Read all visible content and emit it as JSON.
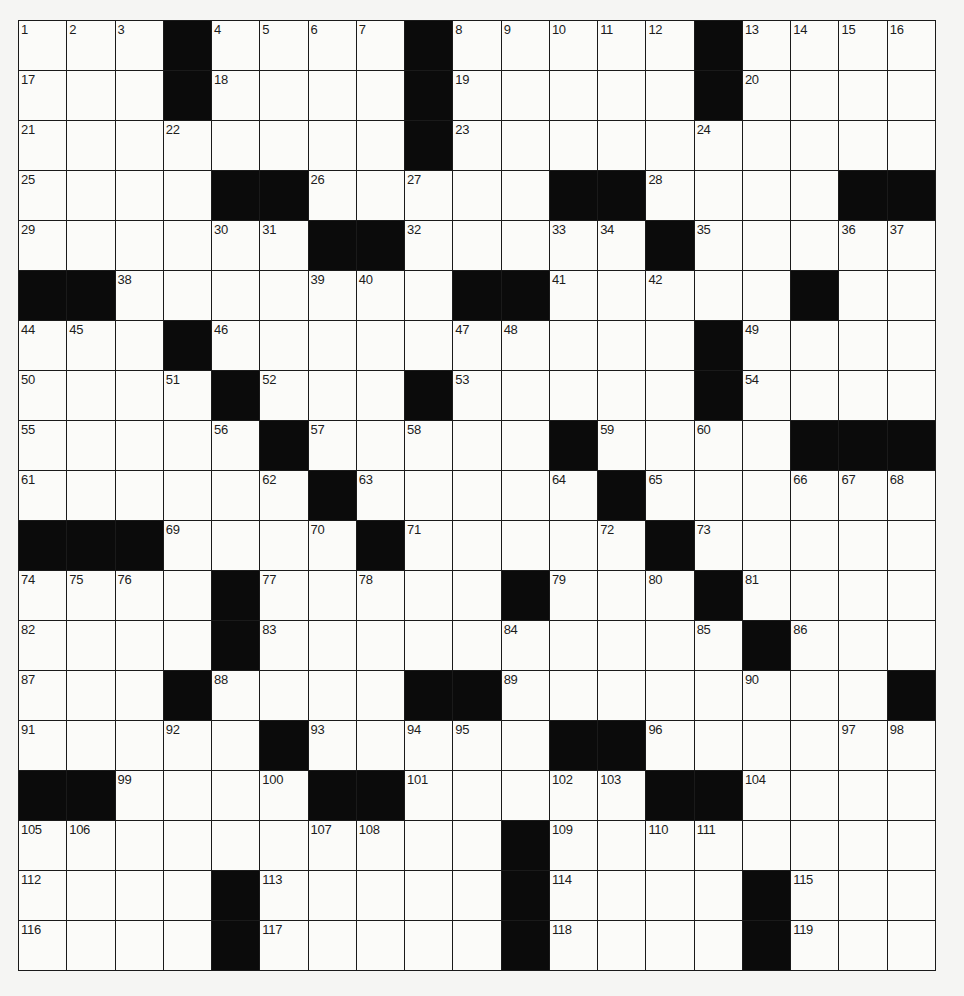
{
  "puzzle": {
    "rows": 19,
    "cols": 19,
    "colors": {
      "background": "#f5f5f3",
      "cell_white": "#fbfbf9",
      "cell_black": "#0b0b0b",
      "grid_line": "#1a1a1a",
      "number_text": "#1c1c1c"
    },
    "layout": [
      "...#....#.....#....",
      "...#....#.....#....",
      "........#..........",
      "....##.....##....##",
      "......##.....#.....",
      "##.......##.....#..",
      "...#..........#....",
      "....#...#.....#....",
      ".....#.....#....###",
      "......#.....#......",
      "###....#.....#.....",
      "....#.....#...#....",
      "....#..........#...",
      "...#....##........##",
      ".....#.....##......",
      "##....##.....##....",
      "..........#........",
      "....#.....#....#...",
      "....#.....#....#..."
    ],
    "numbers": [
      [
        1,
        2,
        3,
        0,
        4,
        5,
        6,
        7,
        0,
        8,
        9,
        10,
        11,
        12,
        0,
        13,
        14,
        15,
        16
      ],
      [
        17,
        0,
        0,
        0,
        18,
        0,
        0,
        0,
        0,
        19,
        0,
        0,
        0,
        0,
        0,
        20,
        0,
        0,
        0
      ],
      [
        21,
        0,
        0,
        22,
        0,
        0,
        0,
        0,
        0,
        23,
        0,
        0,
        0,
        0,
        24,
        0,
        0,
        0,
        0
      ],
      [
        25,
        0,
        0,
        0,
        0,
        0,
        26,
        0,
        27,
        0,
        0,
        0,
        0,
        28,
        0,
        0,
        0,
        0,
        0
      ],
      [
        29,
        0,
        0,
        0,
        30,
        31,
        0,
        0,
        32,
        0,
        0,
        33,
        34,
        0,
        35,
        0,
        0,
        36,
        37
      ],
      [
        0,
        0,
        38,
        0,
        0,
        0,
        39,
        40,
        0,
        0,
        0,
        41,
        0,
        42,
        0,
        0,
        43,
        0,
        0
      ],
      [
        44,
        45,
        0,
        0,
        46,
        0,
        0,
        0,
        0,
        47,
        48,
        0,
        0,
        0,
        0,
        49,
        0,
        0,
        0
      ],
      [
        50,
        0,
        0,
        51,
        0,
        52,
        0,
        0,
        0,
        53,
        0,
        0,
        0,
        0,
        0,
        54,
        0,
        0,
        0
      ],
      [
        55,
        0,
        0,
        0,
        56,
        0,
        57,
        0,
        58,
        0,
        0,
        0,
        59,
        0,
        60,
        0,
        0,
        0,
        0
      ],
      [
        61,
        0,
        0,
        0,
        0,
        62,
        0,
        63,
        0,
        0,
        0,
        64,
        0,
        65,
        0,
        0,
        66,
        67,
        68
      ],
      [
        0,
        0,
        0,
        69,
        0,
        0,
        70,
        0,
        71,
        0,
        0,
        0,
        72,
        0,
        73,
        0,
        0,
        0,
        0
      ],
      [
        74,
        75,
        76,
        0,
        0,
        77,
        0,
        78,
        0,
        0,
        0,
        79,
        0,
        80,
        0,
        81,
        0,
        0,
        0
      ],
      [
        82,
        0,
        0,
        0,
        0,
        83,
        0,
        0,
        0,
        0,
        84,
        0,
        0,
        0,
        85,
        0,
        86,
        0,
        0
      ],
      [
        87,
        0,
        0,
        0,
        88,
        0,
        0,
        0,
        0,
        0,
        89,
        0,
        0,
        0,
        0,
        90,
        0,
        0,
        0
      ],
      [
        91,
        0,
        0,
        92,
        0,
        0,
        93,
        0,
        94,
        95,
        0,
        0,
        0,
        96,
        0,
        0,
        0,
        97,
        98
      ],
      [
        0,
        0,
        99,
        0,
        0,
        100,
        0,
        0,
        101,
        0,
        0,
        102,
        103,
        0,
        0,
        104,
        0,
        0,
        0
      ],
      [
        105,
        106,
        0,
        0,
        0,
        0,
        107,
        108,
        0,
        0,
        0,
        109,
        0,
        110,
        111,
        0,
        0,
        0,
        0
      ],
      [
        112,
        0,
        0,
        0,
        0,
        113,
        0,
        0,
        0,
        0,
        0,
        114,
        0,
        0,
        0,
        0,
        115,
        0,
        0
      ],
      [
        116,
        0,
        0,
        0,
        0,
        117,
        0,
        0,
        0,
        0,
        0,
        118,
        0,
        0,
        0,
        0,
        119,
        0,
        0
      ]
    ],
    "entries": {}
  }
}
